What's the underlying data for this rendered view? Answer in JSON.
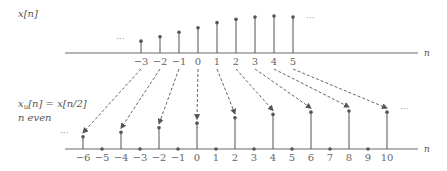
{
  "top": {
    "label": "x[n]",
    "axis_label": "n",
    "ellipsis_left": "···",
    "ellipsis_right": "···",
    "samples": [
      {
        "n": -3,
        "value": 0.32
      },
      {
        "n": -2,
        "value": 0.44
      },
      {
        "n": -1,
        "value": 0.56
      },
      {
        "n": 0,
        "value": 0.68
      },
      {
        "n": 1,
        "value": 0.82
      },
      {
        "n": 2,
        "value": 0.91
      },
      {
        "n": 3,
        "value": 0.97
      },
      {
        "n": 4,
        "value": 1.0
      },
      {
        "n": 5,
        "value": 0.97
      }
    ],
    "tick_labels": [
      "−3",
      "−2",
      "−1",
      "0",
      "1",
      "2",
      "3",
      "4",
      "5"
    ]
  },
  "bottom": {
    "label_line1": "x_u[n] = x[n/2]",
    "label_main": "x",
    "label_sub": "u",
    "label_rest": "[n] = x[n/2]",
    "label_line2": "n even",
    "axis_label": "n",
    "ellipsis_left": "···",
    "ellipsis_right": "···",
    "tick_labels": [
      "−6",
      "−5",
      "−4",
      "−3",
      "−2",
      "−1",
      "0",
      "1",
      "2",
      "3",
      "4",
      "5",
      "6",
      "7",
      "8",
      "9",
      "10"
    ],
    "n_range": [
      -6,
      10
    ]
  },
  "arrows": {
    "description": "dashed arrows map x[k] to x_u[2k]",
    "mapping": [
      [
        -3,
        -6
      ],
      [
        -2,
        -4
      ],
      [
        -1,
        -2
      ],
      [
        0,
        0
      ],
      [
        1,
        2
      ],
      [
        2,
        4
      ],
      [
        3,
        6
      ],
      [
        4,
        8
      ],
      [
        5,
        10
      ]
    ]
  }
}
